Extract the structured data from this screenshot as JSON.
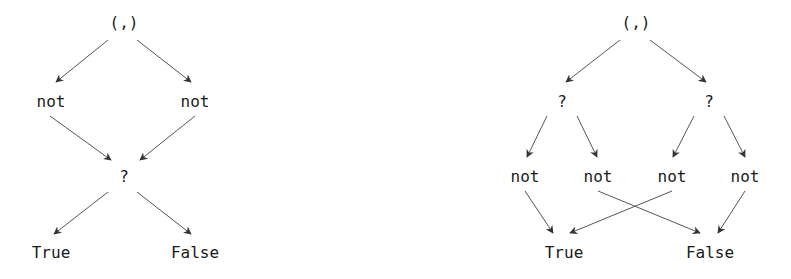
{
  "diagrams": [
    {
      "id": "left",
      "nodes": [
        {
          "id": "pair",
          "label": "(,)",
          "x": 124,
          "y": 22
        },
        {
          "id": "not1",
          "label": "not",
          "x": 51,
          "y": 101
        },
        {
          "id": "not2",
          "label": "not",
          "x": 195,
          "y": 101
        },
        {
          "id": "q",
          "label": "?",
          "x": 124,
          "y": 176
        },
        {
          "id": "true",
          "label": "True",
          "x": 51,
          "y": 252
        },
        {
          "id": "false",
          "label": "False",
          "x": 195,
          "y": 252
        }
      ],
      "edges": [
        {
          "from": "pair",
          "to": "not1",
          "x1": 108,
          "y1": 40,
          "x2": 56,
          "y2": 82
        },
        {
          "from": "pair",
          "to": "not2",
          "x1": 137,
          "y1": 40,
          "x2": 191,
          "y2": 82
        },
        {
          "from": "not1",
          "to": "q",
          "x1": 50,
          "y1": 116,
          "x2": 111,
          "y2": 160
        },
        {
          "from": "not2",
          "to": "q",
          "x1": 195,
          "y1": 116,
          "x2": 140,
          "y2": 160
        },
        {
          "from": "q",
          "to": "true",
          "x1": 108,
          "y1": 192,
          "x2": 54,
          "y2": 234
        },
        {
          "from": "q",
          "to": "false",
          "x1": 137,
          "y1": 192,
          "x2": 191,
          "y2": 234
        }
      ]
    },
    {
      "id": "right",
      "nodes": [
        {
          "id": "pair",
          "label": "(,)",
          "x": 636,
          "y": 22
        },
        {
          "id": "q1",
          "label": "?",
          "x": 562,
          "y": 101
        },
        {
          "id": "q2",
          "label": "?",
          "x": 709,
          "y": 101
        },
        {
          "id": "not1",
          "label": "not",
          "x": 525,
          "y": 176
        },
        {
          "id": "not2",
          "label": "not",
          "x": 598,
          "y": 176
        },
        {
          "id": "not3",
          "label": "not",
          "x": 672,
          "y": 176
        },
        {
          "id": "not4",
          "label": "not",
          "x": 745,
          "y": 176
        },
        {
          "id": "true",
          "label": "True",
          "x": 564,
          "y": 252
        },
        {
          "id": "false",
          "label": "False",
          "x": 710,
          "y": 252
        }
      ],
      "edges": [
        {
          "from": "pair",
          "to": "q1",
          "x1": 620,
          "y1": 40,
          "x2": 566,
          "y2": 82
        },
        {
          "from": "pair",
          "to": "q2",
          "x1": 650,
          "y1": 40,
          "x2": 706,
          "y2": 82
        },
        {
          "from": "q1",
          "to": "not1",
          "x1": 547,
          "y1": 116,
          "x2": 527,
          "y2": 157
        },
        {
          "from": "q1",
          "to": "not2",
          "x1": 577,
          "y1": 116,
          "x2": 597,
          "y2": 157
        },
        {
          "from": "q2",
          "to": "not3",
          "x1": 694,
          "y1": 116,
          "x2": 673,
          "y2": 157
        },
        {
          "from": "q2",
          "to": "not4",
          "x1": 724,
          "y1": 116,
          "x2": 745,
          "y2": 157
        },
        {
          "from": "not1",
          "to": "true",
          "x1": 525,
          "y1": 191,
          "x2": 553,
          "y2": 233
        },
        {
          "from": "not3",
          "to": "true",
          "x1": 672,
          "y1": 191,
          "x2": 570,
          "y2": 233
        },
        {
          "from": "not2",
          "to": "false",
          "x1": 598,
          "y1": 191,
          "x2": 700,
          "y2": 233
        },
        {
          "from": "not4",
          "to": "false",
          "x1": 745,
          "y1": 191,
          "x2": 718,
          "y2": 233
        }
      ]
    }
  ]
}
